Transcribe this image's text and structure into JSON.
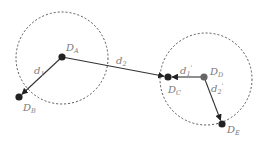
{
  "colors": {
    "background": "#ffffff",
    "circle_stroke": "#555555",
    "edge": "#333333",
    "node_dark": "#222222",
    "node_gray": "#666666",
    "label": "#7a7a7a"
  },
  "circles": [
    {
      "id": "left",
      "cx": 62,
      "cy": 58,
      "r": 46
    },
    {
      "id": "right",
      "cx": 206,
      "cy": 79,
      "r": 46
    }
  ],
  "nodes": [
    {
      "id": "DA",
      "x": 62,
      "y": 57,
      "label": "D",
      "sub": "A",
      "lx": 66,
      "ly": 51
    },
    {
      "id": "DB",
      "x": 19,
      "y": 97,
      "label": "D",
      "sub": "B",
      "lx": 23,
      "ly": 111
    },
    {
      "id": "DC",
      "x": 168,
      "y": 77,
      "label": "D",
      "sub": "C",
      "lx": 168,
      "ly": 93
    },
    {
      "id": "DD",
      "x": 204,
      "y": 77,
      "label": "D",
      "sub": "D",
      "lx": 210,
      "ly": 75
    },
    {
      "id": "DE",
      "x": 222,
      "y": 124,
      "label": "D",
      "sub": "E",
      "lx": 227,
      "ly": 133
    }
  ],
  "edges": [
    {
      "id": "d1",
      "from": "DA",
      "to": "DB",
      "label": "d",
      "sub": "1",
      "sup": "",
      "lx": 34,
      "ly": 74
    },
    {
      "id": "d2",
      "from": "DA",
      "to": "DC",
      "label": "d",
      "sub": "2",
      "sup": "",
      "lx": 116,
      "ly": 64
    },
    {
      "id": "d1p",
      "from": "DD",
      "to": "DC",
      "label": "d",
      "sub": "1",
      "sup": "'",
      "lx": 180,
      "ly": 74
    },
    {
      "id": "d2p",
      "from": "DD",
      "to": "DE",
      "label": "d",
      "sub": "2",
      "sup": "'",
      "lx": 211,
      "ly": 92
    }
  ]
}
